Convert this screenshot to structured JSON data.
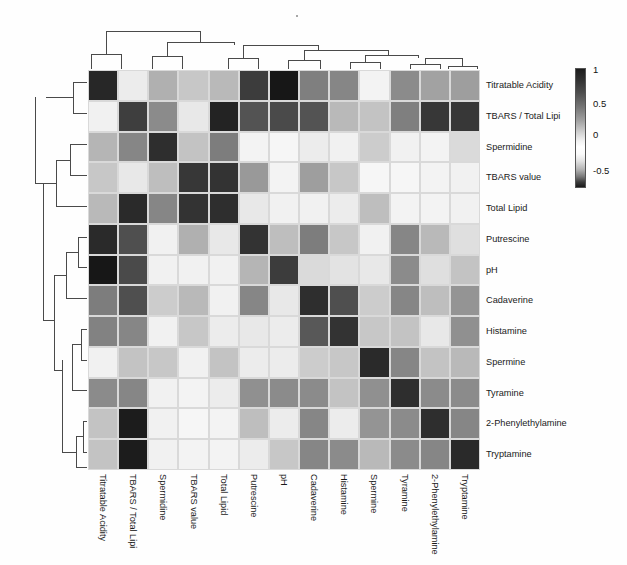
{
  "figure": {
    "type": "heatmap-with-dendrograms",
    "background": "#ffffff"
  },
  "colorbar": {
    "name": "correlation-colorbar",
    "ticks": [
      "1",
      "0.5",
      "0",
      "-0.5"
    ],
    "tick_positions_pct": [
      2,
      30,
      56,
      86
    ],
    "vmin": -0.75,
    "vmax": 1.0,
    "colormap": "diverging-gray (dark-white-dark)"
  },
  "labels": [
    "Titratable Acidity",
    "TBARS / Total Lipi",
    "Spermidine",
    "TBARS value",
    "Total Lipid",
    "Putrescine",
    "pH",
    "Cadaverine",
    "Histamine",
    "Spermine",
    "Tyramine",
    "2-Phenylethylamine",
    "Tryptamine"
  ],
  "chart_data": {
    "type": "heatmap",
    "title": "",
    "xlabel": "",
    "ylabel": "",
    "grid": true,
    "legend_position": "right",
    "categories": [
      "Titratable Acidity",
      "TBARS / Total Lipi",
      "Spermidine",
      "TBARS value",
      "Total Lipid",
      "Putrescine",
      "pH",
      "Cadaverine",
      "Histamine",
      "Spermine",
      "Tyramine",
      "2-Phenylethylamine",
      "Tryptamine"
    ],
    "row_labels": [
      "Titratable Acidity",
      "TBARS / Total Lipi",
      "Spermidine",
      "TBARS value",
      "Total Lipid",
      "Putrescine",
      "pH",
      "Cadaverine",
      "Histamine",
      "Spermine",
      "Tyramine",
      "2-Phenylethylamine",
      "Tryptamine"
    ],
    "column_labels": [
      "Titratable Acidity",
      "TBARS / Total Lipi",
      "Spermidine",
      "TBARS value",
      "Total Lipid",
      "Putrescine",
      "pH",
      "Cadaverine",
      "Histamine",
      "Spermine",
      "Tyramine",
      "2-Phenylethylamine",
      "Tryptamine"
    ],
    "zlim": [
      -0.75,
      1.0
    ],
    "values": [
      [
        0.93,
        0.08,
        0.34,
        0.24,
        0.3,
        0.84,
        1.0,
        0.55,
        0.52,
        0.05,
        0.5,
        0.4,
        0.42
      ],
      [
        0.06,
        0.83,
        0.5,
        0.1,
        0.95,
        0.74,
        0.78,
        0.74,
        0.3,
        0.26,
        0.55,
        0.86,
        0.86
      ],
      [
        0.32,
        0.52,
        0.9,
        0.26,
        0.56,
        0.05,
        0.04,
        0.08,
        0.06,
        0.22,
        0.06,
        0.05,
        0.16
      ],
      [
        0.24,
        0.1,
        0.28,
        0.86,
        0.88,
        0.44,
        0.05,
        0.42,
        0.24,
        0.04,
        0.04,
        0.05,
        0.06
      ],
      [
        0.3,
        0.92,
        0.52,
        0.88,
        0.9,
        0.1,
        0.06,
        0.06,
        0.08,
        0.28,
        0.05,
        0.05,
        0.06
      ],
      [
        0.92,
        0.76,
        0.06,
        0.34,
        0.1,
        0.88,
        0.28,
        0.56,
        0.24,
        0.06,
        0.52,
        0.3,
        0.14
      ],
      [
        1.0,
        0.78,
        0.06,
        0.06,
        0.06,
        0.32,
        0.84,
        0.16,
        0.12,
        0.1,
        0.5,
        0.14,
        0.26
      ],
      [
        0.56,
        0.76,
        0.22,
        0.3,
        0.06,
        0.52,
        0.1,
        0.9,
        0.76,
        0.22,
        0.52,
        0.28,
        0.46
      ],
      [
        0.54,
        0.52,
        0.06,
        0.24,
        0.08,
        0.1,
        0.08,
        0.72,
        0.88,
        0.24,
        0.26,
        0.1,
        0.48
      ],
      [
        0.06,
        0.26,
        0.24,
        0.06,
        0.26,
        0.08,
        0.08,
        0.22,
        0.24,
        0.92,
        0.52,
        0.26,
        0.3
      ],
      [
        0.5,
        0.52,
        0.06,
        0.05,
        0.08,
        0.48,
        0.5,
        0.5,
        0.26,
        0.48,
        0.9,
        0.5,
        0.5
      ],
      [
        0.26,
        0.98,
        0.06,
        0.04,
        0.05,
        0.28,
        0.08,
        0.52,
        0.08,
        0.46,
        0.5,
        0.9,
        0.52
      ],
      [
        0.26,
        0.98,
        0.06,
        0.05,
        0.05,
        0.08,
        0.24,
        0.52,
        0.5,
        0.3,
        0.5,
        0.52,
        0.92
      ]
    ]
  },
  "dendrogram_top": {
    "name": "column-dendrogram",
    "segments": [
      {
        "x1": 3,
        "x2": 3,
        "y1": 26,
        "y2": 41
      },
      {
        "x1": 3,
        "x2": 33,
        "y1": 26,
        "y2": 26
      },
      {
        "x1": 33,
        "x2": 33,
        "y1": 26,
        "y2": 41
      },
      {
        "x1": 18,
        "x2": 18,
        "y1": 3,
        "y2": 26
      },
      {
        "x1": 18,
        "x2": 112,
        "y1": 3,
        "y2": 3
      },
      {
        "x1": 112,
        "x2": 112,
        "y1": 3,
        "y2": 14
      },
      {
        "x1": 64,
        "x2": 64,
        "y1": 28,
        "y2": 41
      },
      {
        "x1": 64,
        "x2": 94,
        "y1": 28,
        "y2": 28
      },
      {
        "x1": 94,
        "x2": 94,
        "y1": 28,
        "y2": 41
      },
      {
        "x1": 79,
        "x2": 79,
        "y1": 14,
        "y2": 28
      },
      {
        "x1": 79,
        "x2": 146,
        "y1": 14,
        "y2": 14
      },
      {
        "x1": 146,
        "x2": 146,
        "y1": 14,
        "y2": 17
      },
      {
        "x1": 140,
        "x2": 140,
        "y1": 30,
        "y2": 41
      },
      {
        "x1": 140,
        "x2": 170,
        "y1": 30,
        "y2": 30
      },
      {
        "x1": 170,
        "x2": 170,
        "y1": 30,
        "y2": 41
      },
      {
        "x1": 155,
        "x2": 155,
        "y1": 17,
        "y2": 30
      },
      {
        "x1": 155,
        "x2": 230,
        "y1": 17,
        "y2": 17
      },
      {
        "x1": 230,
        "x2": 230,
        "y1": 17,
        "y2": 22
      },
      {
        "x1": 200,
        "x2": 200,
        "y1": 32,
        "y2": 41
      },
      {
        "x1": 200,
        "x2": 232,
        "y1": 32,
        "y2": 32
      },
      {
        "x1": 232,
        "x2": 232,
        "y1": 32,
        "y2": 41
      },
      {
        "x1": 216,
        "x2": 216,
        "y1": 22,
        "y2": 32
      },
      {
        "x1": 216,
        "x2": 300,
        "y1": 22,
        "y2": 22
      },
      {
        "x1": 300,
        "x2": 300,
        "y1": 22,
        "y2": 27
      },
      {
        "x1": 262,
        "x2": 262,
        "y1": 34,
        "y2": 41
      },
      {
        "x1": 262,
        "x2": 292,
        "y1": 34,
        "y2": 34
      },
      {
        "x1": 292,
        "x2": 292,
        "y1": 34,
        "y2": 41
      },
      {
        "x1": 277,
        "x2": 277,
        "y1": 27,
        "y2": 34
      },
      {
        "x1": 277,
        "x2": 330,
        "y1": 27,
        "y2": 27
      },
      {
        "x1": 330,
        "x2": 330,
        "y1": 27,
        "y2": 30
      },
      {
        "x1": 322,
        "x2": 322,
        "y1": 36,
        "y2": 41
      },
      {
        "x1": 322,
        "x2": 352,
        "y1": 36,
        "y2": 36
      },
      {
        "x1": 352,
        "x2": 352,
        "y1": 36,
        "y2": 41
      },
      {
        "x1": 337,
        "x2": 337,
        "y1": 30,
        "y2": 36
      },
      {
        "x1": 337,
        "x2": 374,
        "y1": 30,
        "y2": 30
      },
      {
        "x1": 374,
        "x2": 374,
        "y1": 30,
        "y2": 34
      },
      {
        "x1": 360,
        "x2": 360,
        "y1": 38,
        "y2": 41
      },
      {
        "x1": 360,
        "x2": 389,
        "y1": 38,
        "y2": 38
      },
      {
        "x1": 389,
        "x2": 389,
        "y1": 38,
        "y2": 41
      },
      {
        "x1": 374,
        "x2": 374,
        "y1": 34,
        "y2": 38
      }
    ]
  },
  "dendrogram_left": {
    "name": "row-dendrogram",
    "segments": [
      {
        "x1": 47,
        "x2": 61,
        "y1": 12,
        "y2": 12
      },
      {
        "x1": 47,
        "x2": 61,
        "y1": 43,
        "y2": 43
      },
      {
        "x1": 47,
        "x2": 47,
        "y1": 12,
        "y2": 43
      },
      {
        "x1": 20,
        "x2": 47,
        "y1": 27,
        "y2": 27
      },
      {
        "x1": 44,
        "x2": 61,
        "y1": 74,
        "y2": 74
      },
      {
        "x1": 44,
        "x2": 61,
        "y1": 105,
        "y2": 105
      },
      {
        "x1": 44,
        "x2": 44,
        "y1": 74,
        "y2": 105
      },
      {
        "x1": 30,
        "x2": 44,
        "y1": 90,
        "y2": 90
      },
      {
        "x1": 30,
        "x2": 61,
        "y1": 136,
        "y2": 136
      },
      {
        "x1": 30,
        "x2": 30,
        "y1": 90,
        "y2": 136
      },
      {
        "x1": 9,
        "x2": 30,
        "y1": 113,
        "y2": 113
      },
      {
        "x1": 9,
        "x2": 9,
        "y1": 27,
        "y2": 113
      },
      {
        "x1": 52,
        "x2": 61,
        "y1": 167,
        "y2": 167
      },
      {
        "x1": 52,
        "x2": 61,
        "y1": 197,
        "y2": 197
      },
      {
        "x1": 52,
        "x2": 52,
        "y1": 167,
        "y2": 197
      },
      {
        "x1": 40,
        "x2": 52,
        "y1": 182,
        "y2": 182
      },
      {
        "x1": 40,
        "x2": 61,
        "y1": 228,
        "y2": 228
      },
      {
        "x1": 40,
        "x2": 40,
        "y1": 182,
        "y2": 228
      },
      {
        "x1": 55,
        "x2": 61,
        "y1": 259,
        "y2": 259
      },
      {
        "x1": 55,
        "x2": 61,
        "y1": 290,
        "y2": 290
      },
      {
        "x1": 55,
        "x2": 55,
        "y1": 259,
        "y2": 290
      },
      {
        "x1": 46,
        "x2": 55,
        "y1": 274,
        "y2": 274
      },
      {
        "x1": 46,
        "x2": 61,
        "y1": 320,
        "y2": 320
      },
      {
        "x1": 46,
        "x2": 46,
        "y1": 274,
        "y2": 320
      },
      {
        "x1": 57,
        "x2": 61,
        "y1": 351,
        "y2": 351
      },
      {
        "x1": 57,
        "x2": 61,
        "y1": 382,
        "y2": 382
      },
      {
        "x1": 57,
        "x2": 57,
        "y1": 351,
        "y2": 382
      },
      {
        "x1": 50,
        "x2": 57,
        "y1": 366,
        "y2": 366
      },
      {
        "x1": 50,
        "x2": 61,
        "y1": 397,
        "y2": 397
      },
      {
        "x1": 50,
        "x2": 50,
        "y1": 366,
        "y2": 397
      },
      {
        "x1": 36,
        "x2": 50,
        "y1": 382,
        "y2": 382
      },
      {
        "x1": 36,
        "x2": 36,
        "y1": 290,
        "y2": 382
      },
      {
        "x1": 28,
        "x2": 40,
        "y1": 205,
        "y2": 205
      },
      {
        "x1": 28,
        "x2": 36,
        "y1": 300,
        "y2": 300
      },
      {
        "x1": 28,
        "x2": 28,
        "y1": 205,
        "y2": 300
      },
      {
        "x1": 17,
        "x2": 28,
        "y1": 250,
        "y2": 250
      },
      {
        "x1": 17,
        "x2": 17,
        "y1": 113,
        "y2": 250
      }
    ]
  }
}
